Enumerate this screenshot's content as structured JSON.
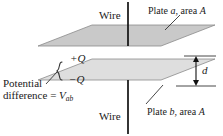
{
  "figure": {
    "labels": {
      "wire_top": "Wire",
      "wire_bottom": "Wire",
      "plate_a_prefix": "Plate ",
      "plate_a_symbol": "a",
      "plate_a_suffix": ", area ",
      "plate_a_area": "A",
      "plate_b_prefix": "Plate ",
      "plate_b_symbol": "b",
      "plate_b_suffix": ", area ",
      "plate_b_area": "A",
      "charge_top": "+Q",
      "charge_bottom": "−Q",
      "separation": "d",
      "potential_line1": "Potential",
      "potential_line2_prefix": "difference = ",
      "potential_line2_symbol": "V",
      "potential_line2_subscript": "ab"
    },
    "colors": {
      "plate_a_fill": "#c9c9c9",
      "plate_b_fill": "#dedede",
      "plate_stroke": "#8a8a8a",
      "wire": "#111111",
      "text": "#1a1a1a",
      "leader": "#333333",
      "background": "#ffffff"
    },
    "geometry": {
      "plate_a_points": "38,46 92,25 215,25 161,46",
      "plate_b_points": "38,80 92,59 215,59 161,80",
      "wire_top": {
        "x": 128,
        "y1": 2,
        "y2": 46
      },
      "wire_bottom": {
        "x": 128,
        "y1": 80,
        "y2": 134
      },
      "separation_arrow": {
        "x": 196,
        "y_top": 56,
        "y_bottom": 86
      },
      "separation_value_note": "d"
    }
  }
}
